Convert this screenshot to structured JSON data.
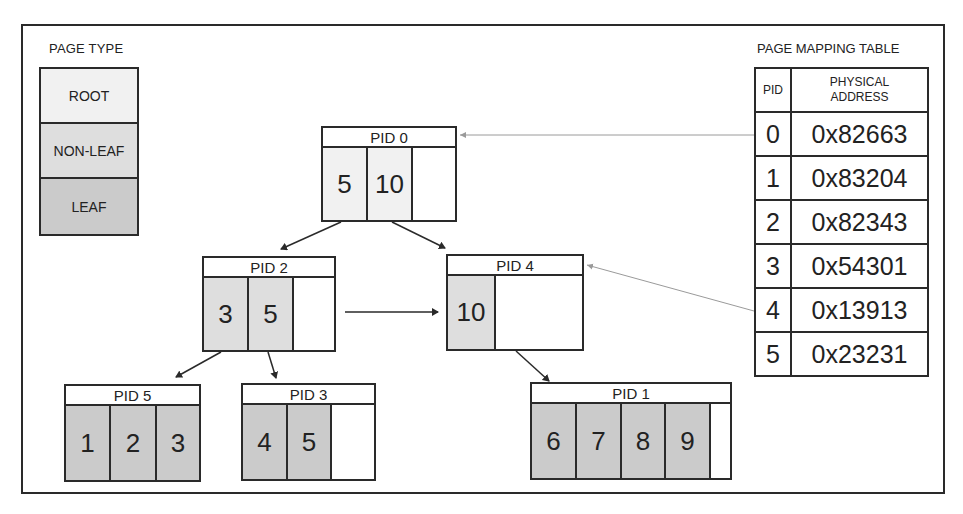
{
  "legend": {
    "title": "PAGE TYPE",
    "items": [
      {
        "label": "ROOT",
        "color": "#f1f1f1"
      },
      {
        "label": "NON-LEAF",
        "color": "#dedede"
      },
      {
        "label": "LEAF",
        "color": "#cbcbcb"
      }
    ]
  },
  "tree": {
    "nodes": [
      {
        "id": "pid0",
        "label": "PID 0",
        "type": "ROOT",
        "keys": [
          "5",
          "10",
          ""
        ]
      },
      {
        "id": "pid2",
        "label": "PID 2",
        "type": "NON-LEAF",
        "keys": [
          "3",
          "5",
          ""
        ]
      },
      {
        "id": "pid4",
        "label": "PID 4",
        "type": "NON-LEAF",
        "keys": [
          "10",
          ""
        ]
      },
      {
        "id": "pid5",
        "label": "PID 5",
        "type": "LEAF",
        "keys": [
          "1",
          "2",
          "3"
        ]
      },
      {
        "id": "pid3",
        "label": "PID 3",
        "type": "LEAF",
        "keys": [
          "4",
          "5",
          ""
        ]
      },
      {
        "id": "pid1",
        "label": "PID 1",
        "type": "LEAF",
        "keys": [
          "6",
          "7",
          "8",
          "9",
          ""
        ]
      }
    ],
    "edges": [
      {
        "from": "PID 0",
        "to": "PID 2"
      },
      {
        "from": "PID 0",
        "to": "PID 4"
      },
      {
        "from": "PID 2",
        "to": "PID 4",
        "kind": "sibling"
      },
      {
        "from": "PID 2",
        "to": "PID 5"
      },
      {
        "from": "PID 2",
        "to": "PID 3"
      },
      {
        "from": "PID 4",
        "to": "PID 1"
      },
      {
        "from": "MAP 0",
        "to": "PID 0",
        "kind": "mapping"
      },
      {
        "from": "MAP 4",
        "to": "PID 4",
        "kind": "mapping"
      }
    ]
  },
  "mapping_table": {
    "title": "PAGE MAPPING TABLE",
    "headers": [
      "PID",
      "PHYSICAL ADDRESS"
    ],
    "rows": [
      {
        "pid": "0",
        "address": "0x82663"
      },
      {
        "pid": "1",
        "address": "0x83204"
      },
      {
        "pid": "2",
        "address": "0x82343"
      },
      {
        "pid": "3",
        "address": "0x54301"
      },
      {
        "pid": "4",
        "address": "0x13913"
      },
      {
        "pid": "5",
        "address": "0x23231"
      }
    ]
  }
}
